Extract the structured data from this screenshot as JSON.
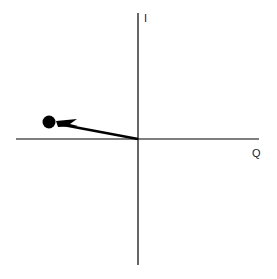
{
  "diagram": {
    "type": "IQ constellation / phasor diagram",
    "axes": {
      "vertical_label": "I",
      "horizontal_label": "Q",
      "origin_px": [
        138,
        139
      ],
      "vertical_px": {
        "x": 138,
        "y1": 13,
        "y2": 265
      },
      "horizontal_px": {
        "y": 139,
        "x1": 16,
        "x2": 259
      }
    },
    "vector": {
      "from_px": [
        138,
        139
      ],
      "to_px": [
        49,
        122
      ],
      "endpoint_radius": 6,
      "color": "#000000"
    },
    "colors": {
      "background": "#ffffff",
      "stroke": "#000000"
    }
  }
}
